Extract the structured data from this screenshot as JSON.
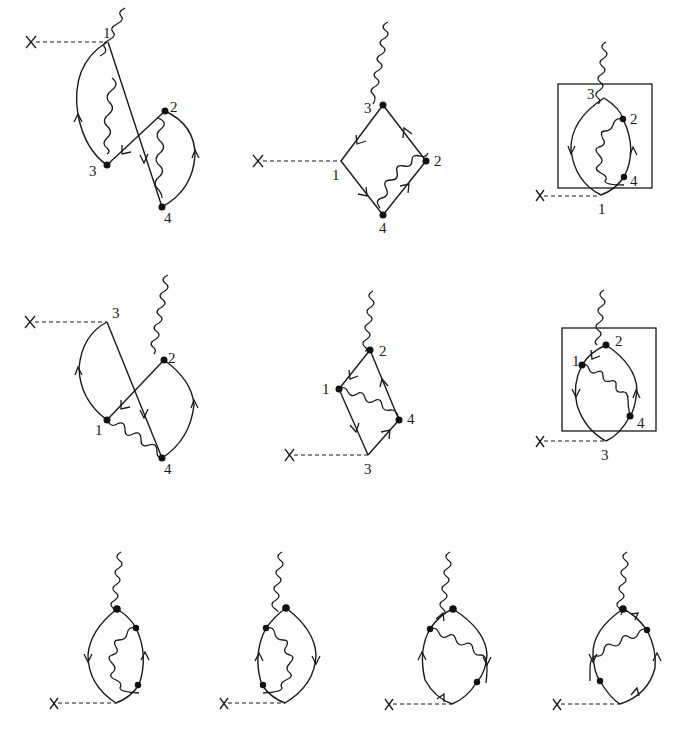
{
  "figure": {
    "rows": 3,
    "diagrams": [
      {
        "id": "d1",
        "row": 1,
        "col": 1,
        "boxed": false,
        "vertex_labels": [
          "1",
          "2",
          "3",
          "4"
        ],
        "labels": {
          "v1": "1",
          "v2": "2",
          "v3": "3",
          "v4": "4"
        }
      },
      {
        "id": "d2",
        "row": 1,
        "col": 2,
        "boxed": false,
        "labels": {
          "v1": "1",
          "v2": "2",
          "v3": "3",
          "v4": "4"
        }
      },
      {
        "id": "d3",
        "row": 1,
        "col": 3,
        "boxed": true,
        "labels": {
          "v1": "1",
          "v2": "2",
          "v3": "3",
          "v4": "4"
        }
      },
      {
        "id": "d4",
        "row": 2,
        "col": 1,
        "boxed": false,
        "labels": {
          "v1": "1",
          "v2": "2",
          "v3": "3",
          "v4": "4"
        }
      },
      {
        "id": "d5",
        "row": 2,
        "col": 2,
        "boxed": false,
        "labels": {
          "v1": "1",
          "v2": "2",
          "v3": "3",
          "v4": "4"
        }
      },
      {
        "id": "d6",
        "row": 2,
        "col": 3,
        "boxed": true,
        "labels": {
          "v1": "1",
          "v2": "2",
          "v3": "3",
          "v4": "4"
        }
      },
      {
        "id": "d7",
        "row": 3,
        "col": 1,
        "boxed": false,
        "labels": {}
      },
      {
        "id": "d8",
        "row": 3,
        "col": 2,
        "boxed": false,
        "labels": {}
      },
      {
        "id": "d9",
        "row": 3,
        "col": 3,
        "boxed": false,
        "labels": {}
      },
      {
        "id": "d10",
        "row": 3,
        "col": 4,
        "boxed": false,
        "labels": {}
      }
    ],
    "legend": {
      "source_marker": "X",
      "dashed_line": "external source",
      "wavy_line": "photon",
      "solid_line_with_arrow": "fermion propagator",
      "dot": "interaction vertex"
    },
    "colors": {
      "ink": "#1a1a1a",
      "background": "#ffffff"
    }
  }
}
